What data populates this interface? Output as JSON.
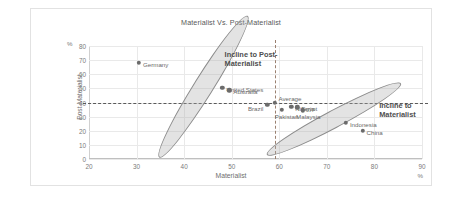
{
  "chart_data": {
    "type": "scatter",
    "title": "Materialist Vs. Post-Materialist",
    "xlabel": "Materialist",
    "ylabel": "Post-Materialist",
    "xlim": [
      20,
      90
    ],
    "ylim": [
      0,
      80
    ],
    "xticks": [
      20,
      30,
      40,
      50,
      60,
      70,
      80,
      90
    ],
    "yticks": [
      0,
      10,
      20,
      30,
      40,
      50,
      60,
      70,
      80
    ],
    "unit_top": "%",
    "unit_bottom": "%",
    "grid": true,
    "legend": "none",
    "reference_lines": [
      {
        "axis": "x",
        "value": 59,
        "style": "dashed"
      },
      {
        "axis": "y",
        "value": 40,
        "style": "dashed"
      }
    ],
    "points": [
      {
        "label": "Germany",
        "x": 30.5,
        "y": 68.0,
        "label_side": "right"
      },
      {
        "label": "United States",
        "x": 48.0,
        "y": 50.5,
        "label_side": "right"
      },
      {
        "label": "Australia",
        "x": 49.5,
        "y": 48.5,
        "label_side": "right"
      },
      {
        "label": "Brazil",
        "x": 57.5,
        "y": 38.5,
        "label_side": "left"
      },
      {
        "label": "Average",
        "x": 59.0,
        "y": 40.0,
        "label_side": "right-up"
      },
      {
        "label": "Pakistan",
        "x": 60.5,
        "y": 35.0,
        "label_side": "below"
      },
      {
        "label": "Nigeria",
        "x": 62.5,
        "y": 37.0,
        "label_side": "right"
      },
      {
        "label": "Egypt",
        "x": 63.8,
        "y": 36.5,
        "label_side": "right"
      },
      {
        "label": "Malaysia",
        "x": 65.0,
        "y": 34.5,
        "label_side": "below"
      },
      {
        "label": "Indonesia",
        "x": 74.0,
        "y": 25.5,
        "label_side": "right"
      },
      {
        "label": "China",
        "x": 77.5,
        "y": 20.0,
        "label_side": "right"
      }
    ],
    "ellipses": [
      {
        "name": "post-materialist-group",
        "cx": 44.0,
        "cy": 51.0,
        "rx": 17.5,
        "ry": 7.0,
        "rotation": -58
      },
      {
        "name": "materialist-group",
        "cx": 71.5,
        "cy": 28.5,
        "rx": 16.0,
        "ry": 6.5,
        "rotation": -28
      }
    ],
    "annotations": [
      {
        "name": "incline-post-materialist",
        "text": "Incline to Post-\nMaterialist",
        "x": 48.5,
        "y": 77.0
      },
      {
        "name": "incline-materialist",
        "text": "Incline to\nMaterialist",
        "x": 81.0,
        "y": 41.0
      }
    ]
  }
}
